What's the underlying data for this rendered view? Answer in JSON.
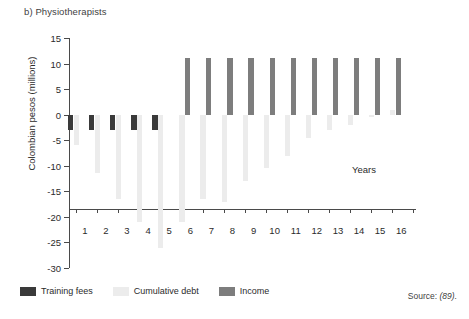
{
  "figure": {
    "panel_label": "b) Physiotherapists",
    "source_prefix": "Source:",
    "source_ref": "(89)."
  },
  "colors": {
    "training_fees": "#3a3a3a",
    "cumulative_debt": "#ececec",
    "income": "#7d7d7d",
    "axis": "#4a4a4a",
    "text": "#2b2b2b"
  },
  "chart_data": {
    "type": "bar",
    "title": "b) Physiotherapists",
    "xlabel": "Years",
    "ylabel": "Colombian pesos (millions)",
    "categories": [
      "1",
      "2",
      "3",
      "4",
      "5",
      "6",
      "7",
      "8",
      "9",
      "10",
      "11",
      "12",
      "13",
      "14",
      "15",
      "16"
    ],
    "ylim": [
      -30,
      15
    ],
    "yticks": [
      15,
      10,
      5,
      0,
      -5,
      -10,
      -15,
      -20,
      -25,
      -30
    ],
    "ytick_labels": [
      "15",
      "10",
      "5",
      "0",
      "-5",
      "-10",
      "-15",
      "-20",
      "-25",
      "-30"
    ],
    "grid": false,
    "legend_position": "bottom-left",
    "series": [
      {
        "name": "Training fees",
        "color": "#3a3a3a",
        "values": [
          -3,
          -3,
          -3,
          -3,
          -3,
          0,
          0,
          0,
          0,
          0,
          0,
          0,
          0,
          0,
          0,
          0
        ]
      },
      {
        "name": "Cumulative debt",
        "color": "#ececec",
        "values": [
          -6,
          -11.5,
          -16.5,
          -21,
          -26,
          -21,
          -16.5,
          -17,
          -13,
          -10.5,
          -8,
          -4.5,
          -3,
          -2,
          -0.5,
          1
        ]
      },
      {
        "name": "Income",
        "color": "#7d7d7d",
        "values": [
          0,
          0,
          0,
          0,
          0,
          11,
          11,
          11,
          11,
          11,
          11,
          11,
          11,
          11,
          11,
          11
        ]
      }
    ]
  }
}
